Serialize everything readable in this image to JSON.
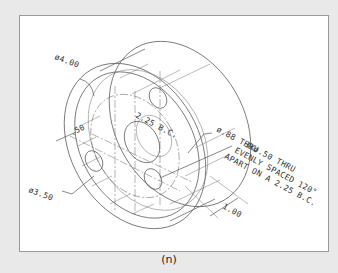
{
  "figure": {
    "caption": "(n)",
    "colors": {
      "background": "#e9e9e9",
      "paper": "#ffffff",
      "lines": "#555555",
      "frame_border": "#9a9a9a"
    }
  },
  "dimensions": {
    "outer_diameter": "ø4.00",
    "inner_diameter": "ø3.50",
    "rim_width": ".50",
    "bolt_circle": "2.25 B.C.",
    "center_hole": "ø.88 THRU",
    "depth": "1.00",
    "bolt_hole_note": {
      "line1": "3Xø.50 THRU",
      "line2": "EVENLY SPACED 120°",
      "line3": "APART ON A 2.25 B.C."
    }
  }
}
